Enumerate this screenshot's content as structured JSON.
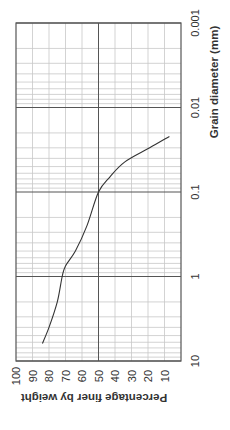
{
  "chart_data": {
    "type": "line",
    "title": "",
    "orientation": "rotated 90 degrees (grain diameter along vertical, percentage along horizontal)",
    "xlabel": "Grain diameter (mm)",
    "ylabel": "Percentage finer by weight",
    "x_scale": "log",
    "x_range": [
      0.001,
      10
    ],
    "x_ticks": [
      0.001,
      0.01,
      0.1,
      1,
      10
    ],
    "x_tick_labels": [
      "0.001",
      "0.01",
      "0.1",
      "1",
      "10"
    ],
    "y_range": [
      0,
      100
    ],
    "y_ticks": [
      100,
      90,
      80,
      70,
      60,
      50,
      40,
      30,
      20,
      10
    ],
    "y_tick_labels": [
      "100",
      "90",
      "80",
      "70",
      "60",
      "50",
      "40",
      "30",
      "20",
      "10"
    ],
    "grid": true,
    "legend": null,
    "series": [
      {
        "name": "Grading curve",
        "color": "#333333",
        "points": [
          {
            "d": 6.2,
            "p": 84
          },
          {
            "d": 4.0,
            "p": 80
          },
          {
            "d": 2.0,
            "p": 75
          },
          {
            "d": 1.0,
            "p": 72
          },
          {
            "d": 0.75,
            "p": 70
          },
          {
            "d": 0.5,
            "p": 64
          },
          {
            "d": 0.25,
            "p": 57
          },
          {
            "d": 0.1,
            "p": 50
          },
          {
            "d": 0.066,
            "p": 43
          },
          {
            "d": 0.044,
            "p": 34
          },
          {
            "d": 0.03,
            "p": 19
          },
          {
            "d": 0.022,
            "p": 7
          }
        ]
      }
    ]
  },
  "colors": {
    "frame": "#555555",
    "major_grid": "#555555",
    "minor_grid": "#c8c8c8",
    "curve": "#333333",
    "text": "#333333"
  }
}
